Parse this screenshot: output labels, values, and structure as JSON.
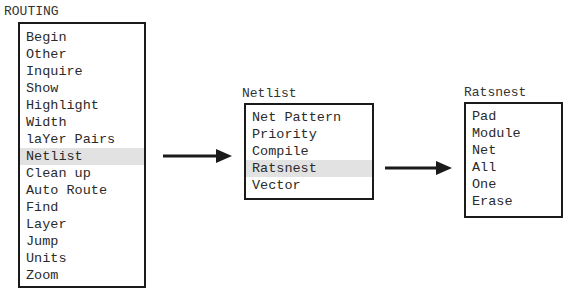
{
  "menus": {
    "routing": {
      "title": "ROUTING",
      "items": [
        "Begin",
        "Other",
        "Inquire",
        "Show",
        "Highlight",
        "Width",
        "laYer Pairs",
        "Netlist",
        "Clean up",
        "Auto Route",
        "Find",
        "Layer",
        "Jump",
        "Units",
        "Zoom"
      ],
      "selected": "Netlist"
    },
    "netlist": {
      "title": "Netlist",
      "items": [
        "Net Pattern",
        "Priority",
        "Compile",
        "Ratsnest",
        "Vector"
      ],
      "selected": "Ratsnest"
    },
    "ratsnest": {
      "title": "Ratsnest",
      "items": [
        "Pad",
        "Module",
        "Net",
        "All",
        "One",
        "Erase"
      ]
    }
  },
  "colors": {
    "border": "#1a1a1a",
    "highlight": "#e2e2e2",
    "arrow": "#1a1a1a"
  }
}
